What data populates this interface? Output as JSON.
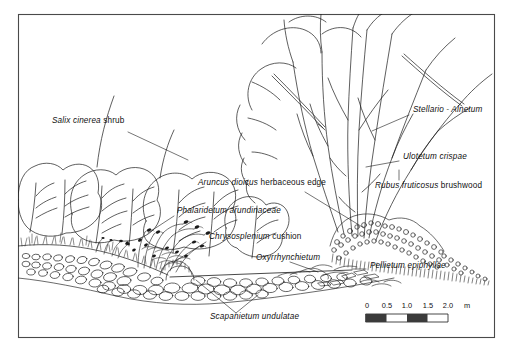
{
  "figure": {
    "caption_labels": [
      {
        "id": "salix-cinerea-shrub",
        "species": "Salix cinerea",
        "qualifier": " shrub",
        "x": 52,
        "y": 121,
        "leader": "M 128 132 L 188 160"
      },
      {
        "id": "stellario-alnetum",
        "species": "Stellario - Alnetum",
        "qualifier": "",
        "x": 413,
        "y": 110,
        "leader": "M 409 115 L 372 131"
      },
      {
        "id": "ulotetum-crispae",
        "species": "Ulotetum crispae",
        "qualifier": "",
        "x": 403,
        "y": 157,
        "leader": "M 399 161 L 366 167"
      },
      {
        "id": "aruncus-dioicus-herbaceous-edge",
        "species": "Aruncus dioicus",
        "qualifier": " herbaceous edge",
        "x": 198,
        "y": 183,
        "leader": "M 305 192 L 364 228"
      },
      {
        "id": "rubus-fruticosus-brushwood",
        "species": "Rubus fruticosus",
        "qualifier": " brushwood",
        "x": 375,
        "y": 186,
        "leader": "M 399 180 L 399 170"
      },
      {
        "id": "phalaridetum-arundinaceae",
        "species": "Phalaridetum arundinaceae",
        "qualifier": "",
        "x": 177,
        "y": 211,
        "leader": "M 174 216 L 148 233"
      },
      {
        "id": "chrysosplenium-cushion",
        "species": "Chrysosplenium",
        "qualifier": " cushion",
        "x": 209,
        "y": 237,
        "leader": "M 206 242 L 174 262"
      },
      {
        "id": "oxyrrhynchietum",
        "species": "Oxyrrhynchietum",
        "qualifier": "",
        "x": 256,
        "y": 258,
        "leader": "M 290 262 L 318 272"
      },
      {
        "id": "pellietum-epiphyllae",
        "species": "Pellietum epiphyllae",
        "qualifier": "",
        "x": 370,
        "y": 266,
        "leader": "M 366 269 L 352 269"
      },
      {
        "id": "scapanietum-undulatae",
        "species": "Scapanietum undulatae",
        "qualifier": "",
        "x": 210,
        "y": 317,
        "leader": "M 236 313 L 258 295"
      }
    ],
    "scale_bar": {
      "ticks": [
        "0",
        "0.5",
        "1.0",
        "1.5",
        "2.0"
      ],
      "unit": "m",
      "x": 366,
      "y": 318,
      "width": 82,
      "height": 8,
      "label_y": 303,
      "unit_x": 455
    },
    "colors": {
      "ink": "#1a1a1a",
      "background": "#ffffff",
      "frame": "#4a4a4a",
      "scale_fill": "#3b3b3b"
    }
  }
}
